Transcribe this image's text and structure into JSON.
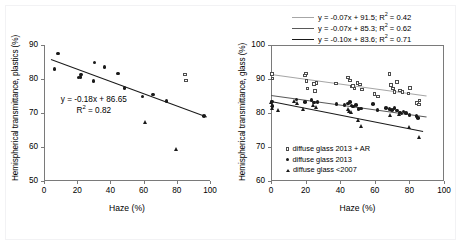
{
  "figure": {
    "background": "#ffffff",
    "frame_color": "#f2f2f4"
  },
  "chart_data": [
    {
      "id": "plastics",
      "type": "scatter",
      "title": "",
      "xlabel": "Haze (%)",
      "ylabel": "Hemispherical transmittance, plastics (%)",
      "xlim": [
        0,
        100
      ],
      "ylim": [
        50,
        90
      ],
      "xticks": [
        0,
        20,
        40,
        60,
        80,
        100
      ],
      "yticks": [
        50,
        60,
        70,
        80,
        90
      ],
      "grid": false,
      "legend": "none",
      "annotations": [
        {
          "text_line1": "y = -0.18x + 86.65",
          "text_line2": "R² = 0.82",
          "x": 30,
          "y": 73.5
        }
      ],
      "series": [
        {
          "name": "circles",
          "marker": "circle",
          "color": "#1a1a1a",
          "points": [
            [
              6.3,
              82.9
            ],
            [
              8.4,
              87.5
            ],
            [
              20.9,
              80.4
            ],
            [
              21.9,
              80.6
            ],
            [
              22.4,
              81.3
            ],
            [
              29.8,
              79.4
            ],
            [
              30.3,
              84.8
            ],
            [
              36.5,
              83.6
            ],
            [
              44.6,
              81.6
            ],
            [
              48.6,
              77.4
            ],
            [
              59.3,
              74.8
            ],
            [
              65.8,
              75.5
            ],
            [
              73.8,
              73.6
            ],
            [
              96.5,
              69.2
            ]
          ]
        },
        {
          "name": "squares",
          "marker": "square",
          "color": "#4d4d4d",
          "points": [
            [
              85.0,
              81.3
            ],
            [
              85.6,
              79.6
            ]
          ]
        },
        {
          "name": "triangles",
          "marker": "triangle",
          "color": "#1a1a1a",
          "points": [
            [
              61.0,
              67.4
            ],
            [
              79.8,
              59.4
            ]
          ]
        }
      ],
      "trendlines": [
        {
          "slope": -0.18,
          "intercept": 86.65,
          "r2": 0.82,
          "color": "#1a1a1a",
          "width": 1.2,
          "x_from": 4,
          "x_to": 98
        }
      ]
    },
    {
      "id": "glass",
      "type": "scatter",
      "title": "",
      "xlabel": "Haze (%)",
      "ylabel": "Hemispherical transmittance, glass (%)",
      "xlim": [
        0,
        100
      ],
      "ylim": [
        60,
        100
      ],
      "xticks": [
        0,
        20,
        40,
        60,
        80,
        100
      ],
      "yticks": [
        60,
        70,
        80,
        90,
        100
      ],
      "grid": false,
      "legend": "inside-lower-left",
      "legend_equations": [
        {
          "text": "y = -0.07x + 91.5; R² = 0.42",
          "color": "#a6a6a6"
        },
        {
          "text": "y = -0.07x + 85.3; R² = 0.62",
          "color": "#595959"
        },
        {
          "text": "y = -0.10x + 83.6; R² = 0.71",
          "color": "#1a1a1a"
        }
      ],
      "legend_series": [
        {
          "label": "diffuse glass 2013 + AR",
          "marker": "square"
        },
        {
          "label": "diffuse glass 2013",
          "marker": "circle"
        },
        {
          "label": "diffuse glass <2007",
          "marker": "triangle"
        }
      ],
      "series": [
        {
          "name": "diffuse glass 2013 + AR",
          "marker": "square",
          "color": "#4d4d4d",
          "points": [
            [
              0.5,
              91.4
            ],
            [
              0.8,
              90.2
            ],
            [
              19.5,
              91.0
            ],
            [
              20.3,
              91.6
            ],
            [
              20.6,
              89.4
            ],
            [
              21.0,
              87.2
            ],
            [
              24.8,
              88.6
            ],
            [
              25.5,
              86.5
            ],
            [
              26.3,
              88.8
            ],
            [
              37.5,
              88.7
            ],
            [
              44.5,
              90.5
            ],
            [
              45.5,
              89.6
            ],
            [
              46.5,
              87.8
            ],
            [
              47.5,
              88.0
            ],
            [
              48.2,
              87.2
            ],
            [
              50.0,
              88.8
            ],
            [
              51.5,
              88.4
            ],
            [
              52.5,
              86.9
            ],
            [
              59.8,
              85.6
            ],
            [
              62.0,
              84.8
            ],
            [
              68.5,
              91.4
            ],
            [
              69.5,
              88.3
            ],
            [
              70.5,
              87.2
            ],
            [
              71.5,
              86.2
            ],
            [
              73.0,
              89.1
            ],
            [
              74.5,
              86.6
            ],
            [
              76.0,
              86.2
            ],
            [
              79.5,
              85.7
            ],
            [
              80.5,
              87.3
            ],
            [
              84.5,
              82.9
            ],
            [
              85.5,
              82.5
            ],
            [
              85.8,
              83.7
            ]
          ]
        },
        {
          "name": "diffuse glass 2013",
          "marker": "circle",
          "color": "#1a1a1a",
          "points": [
            [
              0.6,
              83.4
            ],
            [
              0.9,
              82.1
            ],
            [
              14.8,
              84.0
            ],
            [
              19.8,
              83.3
            ],
            [
              23.5,
              83.9
            ],
            [
              25.0,
              83.1
            ],
            [
              26.8,
              83.2
            ],
            [
              37.8,
              82.7
            ],
            [
              42.5,
              82.3
            ],
            [
              44.5,
              82.8
            ],
            [
              45.5,
              83.2
            ],
            [
              46.5,
              82.2
            ],
            [
              47.5,
              81.9
            ],
            [
              49.0,
              82.3
            ],
            [
              50.5,
              81.2
            ],
            [
              52.0,
              81.3
            ],
            [
              59.0,
              82.7
            ],
            [
              61.5,
              80.9
            ],
            [
              66.5,
              81.5
            ],
            [
              68.5,
              81.2
            ],
            [
              70.0,
              80.9
            ],
            [
              71.5,
              81.5
            ],
            [
              73.0,
              80.7
            ],
            [
              74.5,
              80.2
            ],
            [
              75.5,
              79.9
            ],
            [
              76.5,
              80.4
            ],
            [
              78.0,
              80.0
            ],
            [
              80.0,
              79.4
            ],
            [
              84.0,
              79.2
            ],
            [
              85.0,
              78.6
            ]
          ]
        },
        {
          "name": "diffuse glass <2007",
          "marker": "triangle",
          "color": "#1a1a1a",
          "points": [
            [
              0.4,
              83.2
            ],
            [
              0.7,
              82.3
            ],
            [
              0.9,
              81.5
            ],
            [
              4.5,
              80.8
            ],
            [
              13.5,
              83.6
            ],
            [
              15.5,
              82.9
            ],
            [
              19.0,
              81.2
            ],
            [
              24.5,
              82.4
            ],
            [
              26.0,
              81.7
            ],
            [
              44.5,
              81.0
            ],
            [
              45.5,
              80.6
            ],
            [
              46.5,
              80.3
            ],
            [
              50.5,
              77.8
            ],
            [
              52.5,
              76.2
            ],
            [
              69.0,
              79.4
            ],
            [
              74.5,
              79.6
            ],
            [
              79.8,
              75.8
            ],
            [
              85.5,
              73.0
            ]
          ]
        }
      ],
      "trendlines": [
        {
          "slope": -0.07,
          "intercept": 91.5,
          "r2": 0.42,
          "color": "#a6a6a6",
          "width": 1.2,
          "x_from": 0,
          "x_to": 90
        },
        {
          "slope": -0.07,
          "intercept": 85.3,
          "r2": 0.62,
          "color": "#595959",
          "width": 1.2,
          "x_from": 0,
          "x_to": 90
        },
        {
          "slope": -0.1,
          "intercept": 83.6,
          "r2": 0.71,
          "color": "#1a1a1a",
          "width": 1.2,
          "x_from": 0,
          "x_to": 88
        }
      ]
    }
  ]
}
